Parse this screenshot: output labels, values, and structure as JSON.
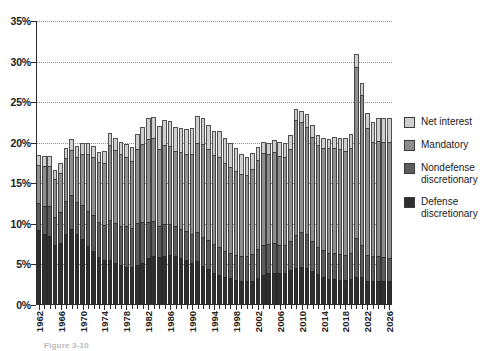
{
  "chart_data": {
    "type": "bar",
    "subtype": "stacked-bar",
    "title": "",
    "xlabel": "",
    "ylabel": "",
    "ylim": [
      0,
      35
    ],
    "yunit": "%",
    "grid": true,
    "legend_position": "right",
    "ytick_labels": [
      "0%",
      "5%",
      "10%",
      "15%",
      "20%",
      "25%",
      "30%",
      "35%"
    ],
    "ytick_values": [
      0,
      5,
      10,
      15,
      20,
      25,
      30,
      35
    ],
    "xtick_labels": [
      "1962",
      "1966",
      "1970",
      "1974",
      "1978",
      "1982",
      "1986",
      "1990",
      "1994",
      "1998",
      "2002",
      "2006",
      "2010",
      "2014",
      "2018",
      "2022",
      "2026"
    ],
    "x_start": 1962,
    "x_end": 2026,
    "categories": [
      1962,
      1963,
      1964,
      1965,
      1966,
      1967,
      1968,
      1969,
      1970,
      1971,
      1972,
      1973,
      1974,
      1975,
      1976,
      1977,
      1978,
      1979,
      1980,
      1981,
      1982,
      1983,
      1984,
      1985,
      1986,
      1987,
      1988,
      1989,
      1990,
      1991,
      1992,
      1993,
      1994,
      1995,
      1996,
      1997,
      1998,
      1999,
      2000,
      2001,
      2002,
      2003,
      2004,
      2005,
      2006,
      2007,
      2008,
      2009,
      2010,
      2011,
      2012,
      2013,
      2014,
      2015,
      2016,
      2017,
      2018,
      2019,
      2020,
      2021,
      2022,
      2023,
      2024,
      2025,
      2026
    ],
    "series": [
      {
        "name": "Defense discretionary",
        "color": "#2f2f2f",
        "values": [
          9.2,
          8.8,
          8.5,
          7.4,
          7.7,
          8.8,
          9.4,
          8.7,
          8.1,
          7.3,
          6.7,
          5.9,
          5.5,
          5.6,
          5.2,
          4.9,
          4.7,
          4.7,
          4.9,
          5.2,
          5.8,
          6.1,
          5.9,
          6.1,
          6.2,
          6.1,
          5.8,
          5.6,
          5.2,
          5.4,
          4.8,
          4.4,
          4.0,
          3.7,
          3.4,
          3.3,
          3.1,
          3.0,
          3.0,
          3.0,
          3.3,
          3.7,
          3.9,
          4.0,
          3.9,
          3.9,
          4.3,
          4.6,
          4.7,
          4.6,
          4.2,
          3.8,
          3.5,
          3.2,
          3.2,
          3.1,
          3.1,
          3.2,
          3.4,
          3.5,
          3.0,
          3.0,
          3.0,
          2.9,
          2.9
        ]
      },
      {
        "name": "Nondefense discretionary",
        "color": "#5c5c5c",
        "values": [
          3.4,
          3.4,
          3.7,
          3.5,
          3.8,
          4.0,
          4.1,
          4.0,
          4.2,
          4.3,
          4.4,
          4.3,
          4.4,
          4.9,
          4.9,
          4.9,
          5.0,
          4.8,
          5.2,
          5.0,
          4.4,
          4.2,
          3.8,
          3.9,
          3.8,
          3.6,
          3.6,
          3.5,
          3.5,
          3.6,
          3.6,
          3.6,
          3.5,
          3.4,
          3.2,
          3.1,
          3.1,
          3.1,
          3.1,
          3.3,
          3.6,
          3.7,
          3.6,
          3.6,
          3.5,
          3.5,
          3.6,
          4.0,
          4.3,
          4.1,
          3.7,
          3.4,
          3.3,
          3.2,
          3.2,
          3.2,
          3.1,
          3.2,
          4.8,
          3.9,
          3.2,
          3.1,
          3.1,
          3.0,
          2.9
        ]
      },
      {
        "name": "Mandatory",
        "color": "#8e8e8e",
        "values": [
          4.7,
          4.9,
          4.9,
          4.6,
          4.8,
          5.3,
          5.6,
          5.6,
          6.3,
          7.0,
          7.2,
          7.4,
          7.6,
          9.2,
          9.0,
          8.8,
          8.5,
          8.3,
          9.1,
          9.6,
          10.2,
          10.3,
          9.5,
          9.7,
          9.6,
          9.3,
          9.4,
          9.5,
          9.9,
          11.0,
          11.4,
          11.2,
          11.0,
          11.1,
          10.9,
          10.6,
          10.3,
          10.0,
          9.9,
          10.5,
          11.0,
          11.3,
          11.1,
          11.2,
          11.0,
          10.9,
          11.3,
          14.2,
          13.6,
          13.3,
          12.8,
          12.5,
          12.5,
          12.9,
          13.0,
          12.9,
          12.8,
          12.9,
          21.1,
          18.5,
          15.6,
          14.0,
          14.1,
          14.2,
          14.3
        ]
      },
      {
        "name": "Net interest",
        "color": "#cfcfcf",
        "values": [
          1.2,
          1.3,
          1.3,
          1.2,
          1.2,
          1.3,
          1.3,
          1.3,
          1.4,
          1.4,
          1.3,
          1.3,
          1.5,
          1.5,
          1.5,
          1.5,
          1.6,
          1.7,
          1.9,
          2.2,
          2.6,
          2.6,
          2.9,
          3.1,
          3.1,
          3.0,
          3.0,
          3.1,
          3.2,
          3.3,
          3.2,
          3.0,
          2.9,
          3.2,
          3.1,
          3.0,
          2.8,
          2.5,
          2.3,
          2.0,
          1.6,
          1.4,
          1.4,
          1.5,
          1.7,
          1.7,
          1.7,
          1.3,
          1.3,
          1.5,
          1.5,
          1.3,
          1.3,
          1.2,
          1.3,
          1.4,
          1.6,
          1.8,
          1.6,
          1.5,
          1.9,
          2.5,
          2.8,
          2.9,
          3.0
        ]
      }
    ]
  },
  "legend": {
    "items": [
      {
        "label_line1": "Net interest",
        "label_line2": "",
        "color": "#cfcfcf"
      },
      {
        "label_line1": "Mandatory",
        "label_line2": "",
        "color": "#8e8e8e"
      },
      {
        "label_line1": "Nondefense",
        "label_line2": "discretionary",
        "color": "#5c5c5c"
      },
      {
        "label_line1": "Defense",
        "label_line2": "discretionary",
        "color": "#2f2f2f"
      }
    ]
  },
  "caption": {
    "text": "Figure 3-10"
  }
}
